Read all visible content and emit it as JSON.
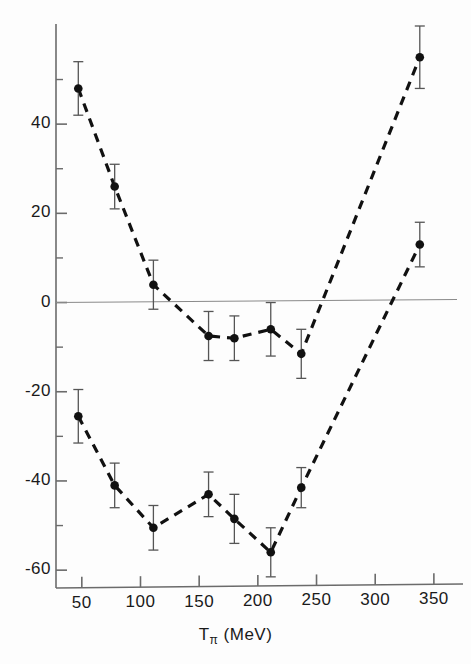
{
  "chart_data": {
    "type": "line",
    "title": "",
    "xlabel": "Tπ (MeV)",
    "xlabel_base": "T",
    "xlabel_sub": "π",
    "xlabel_units": "(MeV)",
    "ylabel": "",
    "xlim": [
      28,
      368
    ],
    "ylim": [
      -64,
      62
    ],
    "x_ticks": [
      50,
      100,
      150,
      200,
      250,
      300,
      350
    ],
    "x_tick_labels": [
      "50",
      "100",
      "150",
      "200",
      "250",
      "300",
      "350"
    ],
    "y_ticks": [
      40,
      20,
      0,
      -20,
      -40,
      -60
    ],
    "y_tick_labels": [
      "40",
      "20",
      "0",
      "-20",
      "-40",
      "-60"
    ],
    "y_minor_ticks": [
      50,
      30,
      10,
      -10,
      -30,
      -50
    ],
    "grid": false,
    "zero_line": true,
    "legend_position": "inline-annotations",
    "marker_color": "#111111",
    "line_color": "#111111",
    "errorbar_color": "#555555",
    "axis_color": "#6b6b6b",
    "series": [
      {
        "name": "Re Vsp(O)",
        "label_base": "Re  V",
        "label_sub": "sp",
        "label_tail": "(O)",
        "annotation_x": 96,
        "annotation_y": 450,
        "x": [
          47,
          78,
          111,
          158,
          180,
          211,
          237,
          338
        ],
        "values": [
          48,
          26,
          4,
          -7.5,
          -8,
          -6,
          -11.5,
          55
        ],
        "errors": [
          6,
          5,
          5.5,
          5.5,
          5,
          6,
          5.5,
          7
        ]
      },
      {
        "name": "Im Vsp(O)",
        "label_base": "Im  V",
        "label_sub": "sp",
        "label_tail": "(O)",
        "annotation_x": 96,
        "annotation_y": 96,
        "x": [
          47,
          78,
          111,
          158,
          180,
          211,
          237,
          338
        ],
        "values": [
          -25.5,
          -41,
          -50.5,
          -43,
          -48.5,
          -56,
          -41.5,
          13
        ],
        "errors": [
          6,
          5,
          5,
          5,
          5.5,
          5.5,
          4.5,
          5
        ]
      }
    ]
  },
  "axes": {
    "x_axis_name": "x-axis",
    "y_axis_name": "y-axis"
  }
}
